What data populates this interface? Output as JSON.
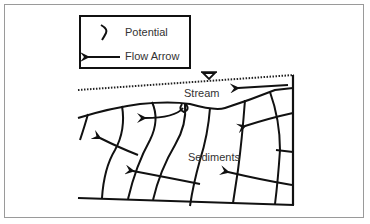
{
  "legend": {
    "items": [
      {
        "icon": "potential-line-icon",
        "label": "Potential"
      },
      {
        "icon": "flow-arrow-icon",
        "label": "Flow Arrow"
      }
    ]
  },
  "labels": {
    "stream": "Stream",
    "sediments": "Sediments"
  },
  "symbols": {
    "water_table": "water-table-triangle-icon"
  },
  "colors": {
    "ink": "#111111",
    "text": "#333333",
    "frame": "#9a9a9a",
    "background": "#ffffff"
  }
}
